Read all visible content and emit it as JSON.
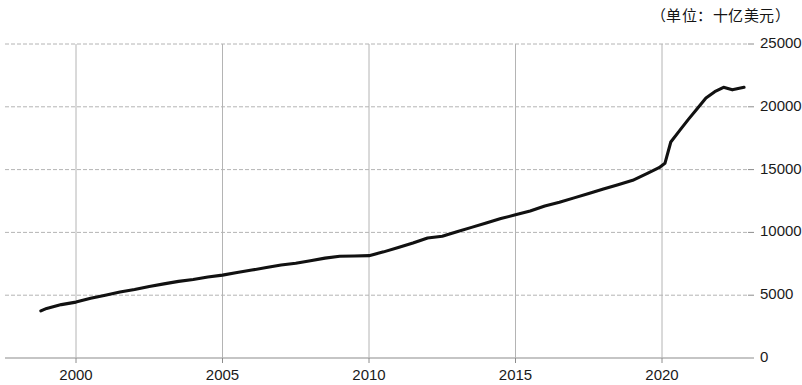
{
  "caption": {
    "unit_note": "（单位：十亿美元）"
  },
  "chart_data": {
    "type": "line",
    "title": "",
    "subtitle": "",
    "annotation": "（单位：十亿美元）",
    "xlabel": "",
    "ylabel": "",
    "xlim": [
      1998.8,
      1998.8
    ],
    "ylim": [
      0,
      25000
    ],
    "grid": true,
    "legend": false,
    "legend_position": "none",
    "line_color": "#111111",
    "grid_color": "#b4b4b4",
    "axis_color": "#8c8c8c",
    "x_ticks": [
      2000,
      2005,
      2010,
      2015,
      2020
    ],
    "x_tick_labels": [
      "2000",
      "2005",
      "2010",
      "2015",
      "2020"
    ],
    "y_ticks": [
      0,
      5000,
      10000,
      15000,
      20000,
      25000
    ],
    "y_tick_labels": [
      "0",
      "5000",
      "10000",
      "15000",
      "20000",
      "25000"
    ],
    "x_range": [
      1998.8,
      1998.8
    ],
    "x_start": 1998.8,
    "x_end": 1998.8,
    "series": [
      {
        "name": "",
        "x": [
          1998.8,
          1999.0,
          1999.5,
          2000.0,
          2000.5,
          2001.0,
          2001.5,
          2002.0,
          2002.5,
          2003.0,
          2003.5,
          2004.0,
          2004.5,
          2005.0,
          2005.5,
          2006.0,
          2006.5,
          2007.0,
          2007.5,
          2008.0,
          2008.5,
          2009.0,
          2009.5,
          2010.0,
          2010.5,
          2011.0,
          2011.5,
          2012.0,
          2012.5,
          2013.0,
          2013.5,
          2014.0,
          2014.5,
          2015.0,
          2015.5,
          2016.0,
          2016.5,
          2017.0,
          2017.5,
          2018.0,
          2018.5,
          2019.0,
          2019.5,
          2019.9,
          2020.1,
          2020.3,
          2020.6,
          2020.9,
          2021.2,
          2021.5,
          2021.8,
          2022.1,
          2022.4,
          2022.8
        ],
        "y": [
          3750,
          3950,
          4250,
          4450,
          4750,
          5000,
          5250,
          5450,
          5700,
          5900,
          6100,
          6250,
          6450,
          6600,
          6800,
          7000,
          7200,
          7400,
          7550,
          7750,
          7950,
          8100,
          8120,
          8150,
          8450,
          8800,
          9150,
          9550,
          9700,
          10050,
          10400,
          10750,
          11100,
          11400,
          11700,
          12100,
          12400,
          12750,
          13100,
          13450,
          13800,
          14150,
          14700,
          15150,
          15500,
          17200,
          18100,
          19000,
          19850,
          20700,
          21200,
          21550,
          21350,
          21550
        ]
      }
    ]
  },
  "axes_geometry": {
    "plot_left_px": 5,
    "plot_right_px": 748,
    "plot_top_px": 44,
    "plot_bottom_px": 358,
    "year_2000_px": 76,
    "px_per_year": 29.3
  }
}
